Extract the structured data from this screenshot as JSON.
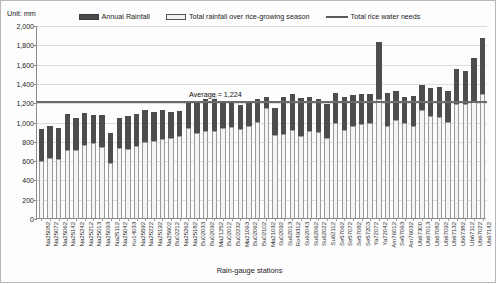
{
  "unit_label": "Unit: mm",
  "legend": {
    "items": [
      {
        "name": "annual-rainfall",
        "label": "Annual Rainfall",
        "type": "bar",
        "color": "#4d4d4d"
      },
      {
        "name": "season-rainfall",
        "label": "Total rainfall over rice-growing season",
        "type": "bar-light",
        "color": "#f4f4f4"
      },
      {
        "name": "rice-water-needs",
        "label": "Total rice water needs",
        "type": "line",
        "color": "#5a5a5a"
      }
    ]
  },
  "annotation": {
    "average_label": "Average = 1,224",
    "average_value": 1224
  },
  "chart_data": {
    "type": "bar",
    "title": "",
    "subtitle": "",
    "xlabel": "Rain-gauge stations",
    "ylabel": "Unit: mm",
    "ylim": [
      0,
      2000
    ],
    "ytick_labels": [
      "0",
      "200",
      "400",
      "600",
      "800",
      "1,000",
      "1,200",
      "1,400",
      "1,600",
      "1,800",
      "2,000"
    ],
    "ytick_values": [
      0,
      200,
      400,
      600,
      800,
      1000,
      1200,
      1400,
      1600,
      1800,
      2000
    ],
    "grid": true,
    "legend_position": "top",
    "categories": [
      "Na25082",
      "Na25072",
      "Na25062",
      "Na25142",
      "Na25242",
      "Na25212",
      "Na25013",
      "Na25093",
      "Na25112",
      "Na25042",
      "Ko14033",
      "Na25592",
      "Na25222",
      "Na25192",
      "Na25602",
      "Bu02212",
      "Na25262",
      "Na25182",
      "Bu02033",
      "Bu02092",
      "Ma21252",
      "Bu02012",
      "Bu02232",
      "Ma21063",
      "Bu02062",
      "Bu02102",
      "Ma21032",
      "Su02092",
      "Su62013",
      "Ro49312",
      "Su62043",
      "Su62062",
      "Su62022",
      "Su62112",
      "Se57062",
      "Se57072",
      "Se57082",
      "Se57203",
      "Ya72072",
      "Ya72042",
      "Am76012",
      "Se57063",
      "Am76032",
      "Ub67300",
      "Ub67013",
      "Ub67082",
      "Ub67092",
      "Ub67132",
      "Ub67382",
      "Ub67112",
      "Ub67022",
      "Ub67142"
    ],
    "series": [
      {
        "name": "Annual Rainfall",
        "color": "#4d4d4d",
        "values": [
          920,
          950,
          935,
          1075,
          1035,
          1090,
          1065,
          1065,
          880,
          1040,
          1060,
          1080,
          1115,
          1095,
          1115,
          1100,
          1110,
          1190,
          1190,
          1230,
          1280,
          1200,
          1190,
          1170,
          1215,
          1235,
          1250,
          1140,
          1250,
          1290,
          1240,
          1255,
          1235,
          1185,
          1300,
          1255,
          1275,
          1280,
          1285,
          1820,
          1295,
          1320,
          1250,
          1265,
          1380,
          1350,
          1360,
          1320,
          1540,
          1520,
          1660,
          1870
        ]
      },
      {
        "name": "Total rainfall over rice-growing season",
        "color": "#f4f4f4",
        "values": [
          590,
          620,
          615,
          700,
          705,
          760,
          775,
          740,
          575,
          730,
          720,
          745,
          790,
          800,
          815,
          830,
          850,
          930,
          880,
          900,
          905,
          930,
          945,
          920,
          955,
          1000,
          1140,
          860,
          870,
          910,
          850,
          905,
          895,
          830,
          985,
          915,
          955,
          975,
          985,
          1230,
          955,
          1020,
          985,
          950,
          1120,
          1060,
          1050,
          1000,
          1185,
          1180,
          1210,
          1285
        ]
      }
    ],
    "reference_line": {
      "name": "Total rice water needs",
      "value": 1224,
      "color": "#6b6b6b",
      "label": "Average = 1,224"
    }
  }
}
